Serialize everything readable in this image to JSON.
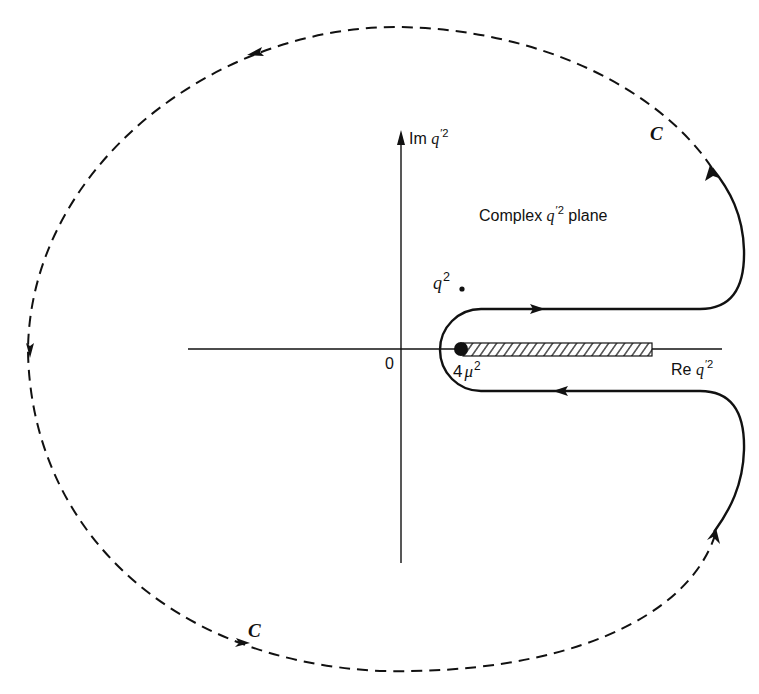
{
  "diagram": {
    "plane_label": {
      "prefix": "Complex ",
      "var": "q",
      "prime_sup": "′",
      "sup": "2",
      "suffix": " plane"
    },
    "im_axis_label": {
      "prefix": "Im ",
      "var": "q",
      "prime_sup": "′",
      "sup": "2"
    },
    "re_axis_label": {
      "prefix": "Re ",
      "var": "q",
      "prime_sup": "′",
      "sup": "2"
    },
    "origin_label": "0",
    "pole_label": {
      "var": "q",
      "sup": "2"
    },
    "branch_point_label": {
      "coef": "4",
      "var": "μ",
      "sup": "2"
    },
    "contour_label_top": "C",
    "contour_label_bottom": "C",
    "colors": {
      "ink": "#111111",
      "background": "#ffffff"
    }
  }
}
